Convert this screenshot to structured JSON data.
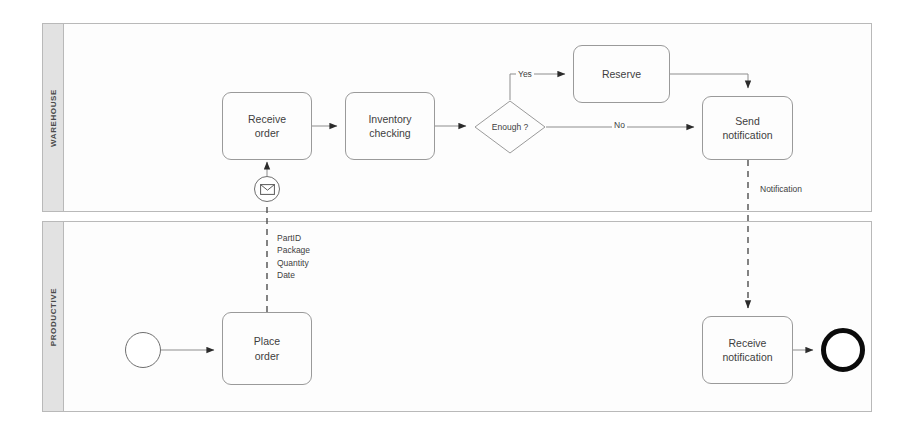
{
  "diagram": {
    "type": "bpmn-collaboration-diagram",
    "background": "#ffffff",
    "line_color": "#9a9a9a",
    "pool_header_fill": "#e2e2e2"
  },
  "pools": [
    {
      "id": "warehouse",
      "label": "WAREHOUSE",
      "x": 42,
      "y": 23,
      "width": 830,
      "height": 189
    },
    {
      "id": "productive",
      "label": "PRODUCTIVE",
      "x": 42,
      "y": 221,
      "width": 830,
      "height": 191
    }
  ],
  "tasks": [
    {
      "id": "receive-order",
      "label": "Receive\norder",
      "line1": "Receive",
      "line2": "order",
      "x": 222,
      "y": 92,
      "width": 90,
      "height": 68
    },
    {
      "id": "inventory-checking",
      "label": "Inventory\nchecking",
      "line1": "Inventory",
      "line2": "checking",
      "x": 345,
      "y": 92,
      "width": 90,
      "height": 68
    },
    {
      "id": "reserve",
      "label": "Reserve",
      "line1": "Reserve",
      "line2": "",
      "x": 573,
      "y": 45,
      "width": 97,
      "height": 58
    },
    {
      "id": "send-notification",
      "label": "Send\nnotification",
      "line1": "Send",
      "line2": "notification",
      "x": 702,
      "y": 96,
      "width": 91,
      "height": 64
    },
    {
      "id": "place-order",
      "label": "Place\norder",
      "line1": "Place",
      "line2": "order",
      "x": 222,
      "y": 312,
      "width": 90,
      "height": 73
    },
    {
      "id": "receive-notification",
      "label": "Receive\nnotification",
      "line1": "Receive",
      "line2": "notification",
      "x": 702,
      "y": 316,
      "width": 91,
      "height": 68
    }
  ],
  "gateways": [
    {
      "id": "enough",
      "label": "Enough ?",
      "cx": 510,
      "cy": 127,
      "rx": 36,
      "ry": 27
    }
  ],
  "events": [
    {
      "id": "start-event",
      "kind": "start",
      "icon": "empty-circle",
      "cx": 143,
      "cy": 350,
      "r": 18
    },
    {
      "id": "end-event",
      "kind": "end",
      "icon": "thick-circle",
      "cx": 843,
      "cy": 350,
      "r": 22
    },
    {
      "id": "message-catch-event",
      "kind": "intermediate-catch",
      "icon": "envelope-icon",
      "cx": 267,
      "cy": 189,
      "r": 13
    }
  ],
  "flow_labels": [
    {
      "id": "yes-label",
      "text": "Yes",
      "x": 516,
      "y": 69
    },
    {
      "id": "no-label",
      "text": "No",
      "x": 612,
      "y": 120
    },
    {
      "id": "notification-label",
      "text": "Notification",
      "x": 758,
      "y": 184
    }
  ],
  "message_payload": {
    "id": "order-message-payload",
    "x": 277,
    "y": 232,
    "items": [
      "PartID",
      "Package",
      "Quantity",
      "Date"
    ]
  },
  "connections": [
    {
      "id": "start-to-place-order",
      "from": "start-event",
      "to": "place-order"
    },
    {
      "id": "place-order-to-message-event",
      "from": "place-order",
      "to": "message-catch-event",
      "style": "message-flow"
    },
    {
      "id": "message-event-to-receive-order",
      "from": "message-catch-event",
      "to": "receive-order"
    },
    {
      "id": "receive-to-inventory",
      "from": "receive-order",
      "to": "inventory-checking"
    },
    {
      "id": "inventory-to-gateway",
      "from": "inventory-checking",
      "to": "enough"
    },
    {
      "id": "gateway-yes-to-reserve",
      "from": "enough",
      "to": "reserve",
      "label": "Yes"
    },
    {
      "id": "gateway-no-to-send",
      "from": "enough",
      "to": "send-notification",
      "label": "No"
    },
    {
      "id": "reserve-to-send",
      "from": "reserve",
      "to": "send-notification"
    },
    {
      "id": "send-to-receive-notification",
      "from": "send-notification",
      "to": "receive-notification",
      "style": "message-flow",
      "label": "Notification"
    },
    {
      "id": "receive-notification-to-end",
      "from": "receive-notification",
      "to": "end-event"
    }
  ]
}
